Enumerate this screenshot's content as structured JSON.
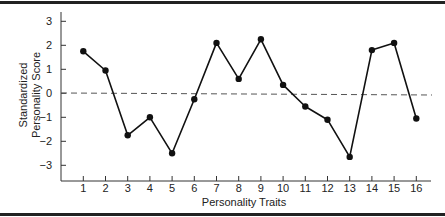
{
  "chart_data": {
    "type": "line",
    "title": "",
    "xlabel": "Personality Traits",
    "ylabel_lines": [
      "Standardized",
      "Personality Score"
    ],
    "ylabel": "Standardized Personality Score",
    "categories": [
      "1",
      "2",
      "3",
      "4",
      "5",
      "6",
      "7",
      "8",
      "9",
      "10",
      "11",
      "12",
      "13",
      "14",
      "15",
      "16"
    ],
    "x": [
      1,
      2,
      3,
      4,
      5,
      6,
      7,
      8,
      9,
      10,
      11,
      12,
      13,
      14,
      15,
      16
    ],
    "values": [
      1.75,
      0.95,
      -1.75,
      -1.0,
      -2.5,
      -0.25,
      2.1,
      0.6,
      2.25,
      0.35,
      -0.55,
      -1.1,
      -2.65,
      1.8,
      2.1,
      -1.05
    ],
    "yticks": [
      3,
      2,
      1,
      0,
      -1,
      -2,
      -3
    ],
    "ytick_labels": [
      "3",
      "2",
      "1",
      "0",
      "−1",
      "−2",
      "−3"
    ],
    "ylim": [
      -3.5,
      3.4
    ],
    "xlim": [
      0.1,
      16.7
    ],
    "reference_line": {
      "y": 0,
      "style": "dashed"
    },
    "grid": false,
    "legend": null,
    "colors": {
      "line": "#111111",
      "marker": "#111111",
      "reference": "#555555",
      "frame": "#222222"
    }
  }
}
